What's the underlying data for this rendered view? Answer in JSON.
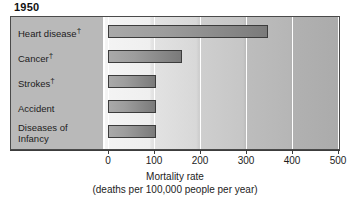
{
  "chart_data": {
    "type": "bar",
    "orientation": "horizontal",
    "title": "1950",
    "xlabel": "Mortality rate",
    "xlabel_sub": "(deaths per 100,000 people per year)",
    "ylabel": "",
    "xlim": [
      0,
      500
    ],
    "xticks": [
      0,
      100,
      200,
      300,
      400,
      500
    ],
    "xtick_labels": [
      "0",
      "100",
      "200",
      "300",
      "400",
      "500"
    ],
    "grid": "vertical",
    "legend": "none",
    "categories": [
      "Heart disease†",
      "Cancer†",
      "Strokes†",
      "Accident",
      "Diseases of Infancy"
    ],
    "category_lines": [
      [
        "Heart disease",
        "†"
      ],
      [
        "Cancer",
        "†"
      ],
      [
        "Strokes",
        "†"
      ],
      [
        "Accident",
        ""
      ],
      [
        "Diseases of",
        "Infancy"
      ]
    ],
    "values": [
      348,
      160,
      105,
      105,
      105
    ],
    "units": "deaths per 100,000 people per year",
    "series": [
      {
        "name": "Mortality rate 1950",
        "values": [
          348,
          160,
          105,
          105,
          105
        ]
      }
    ],
    "colors": {
      "bar_fill_light": "#a9a9a9",
      "bar_fill_dark": "#7a7a7a",
      "bar_border": "#3c3c3c",
      "label_panel": "#b9b9b9",
      "plot_bg_left": "#f4f4f4",
      "plot_bg_right": "#ababab",
      "gridline": "#ffffff",
      "axis": "#3c3c3c",
      "text": "#1c1c1c"
    }
  },
  "chart": {
    "title": "1950",
    "categories": [
      {
        "line1": "Heart disease",
        "dagger": "†",
        "line2": ""
      },
      {
        "line1": "Cancer",
        "dagger": "†",
        "line2": ""
      },
      {
        "line1": "Strokes",
        "dagger": "†",
        "line2": ""
      },
      {
        "line1": "Accident",
        "dagger": "",
        "line2": ""
      },
      {
        "line1": "Diseases of",
        "dagger": "",
        "line2": "Infancy"
      }
    ],
    "ticks": [
      "0",
      "100",
      "200",
      "300",
      "400",
      "500"
    ],
    "axis_caption_line1": "Mortality rate",
    "axis_caption_line2": "(deaths per 100,000 people per year)"
  }
}
